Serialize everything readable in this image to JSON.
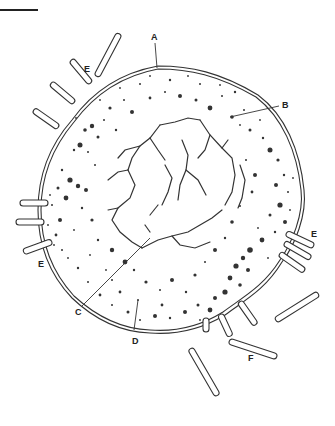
{
  "figure": {
    "type": "labeled biological diagram",
    "scale_bar": true
  },
  "labels": {
    "A": "A",
    "B": "B",
    "C": "C",
    "D": "D",
    "E1": "E",
    "E2": "E",
    "E3": "E",
    "F": "F"
  },
  "colors": {
    "ink": "#333333",
    "background": "#ffffff"
  }
}
